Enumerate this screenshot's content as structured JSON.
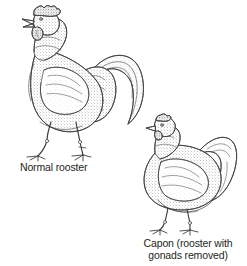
{
  "figure": {
    "background_color": "#ffffff",
    "ink_color": "#231f20",
    "line_color": "#4a4a4a",
    "stipple_color": "#6b6b6b",
    "width": 247,
    "height": 266,
    "style": "pen-and-ink stipple line drawing"
  },
  "specimens": [
    {
      "id": "normal-rooster",
      "caption": "Normal rooster",
      "traits": {
        "comb": "large upright single comb",
        "wattles": "large",
        "tail": "long arched sickle feathers",
        "legs": "long",
        "posture": "upright erect",
        "body": "slender angular"
      }
    },
    {
      "id": "capon",
      "caption_line_1": "Capon (rooster with",
      "caption_line_2": "gonads removed)",
      "caption": "Capon (rooster with\ngonads removed)",
      "traits": {
        "comb": "small reduced comb",
        "wattles": "small",
        "tail": "short rounded tail",
        "legs": "short",
        "posture": "horizontal crouched",
        "body": "plump rounded heavy"
      }
    }
  ]
}
